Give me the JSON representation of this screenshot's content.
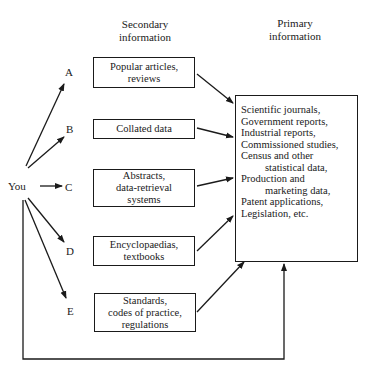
{
  "headers": {
    "secondary": "Secondary\ninformation",
    "primary": "Primary\ninformation"
  },
  "origin": "You",
  "routes": [
    {
      "letter": "A",
      "box": "Popular articles,\nreviews"
    },
    {
      "letter": "B",
      "box": "Collated data"
    },
    {
      "letter": "C",
      "box": "Abstracts,\ndata-retrieval\nsystems"
    },
    {
      "letter": "D",
      "box": "Encyclopaedias,\ntextbooks"
    },
    {
      "letter": "E",
      "box": "Standards,\ncodes of practice,\nregulations"
    }
  ],
  "primary_box": {
    "lines": [
      "Scientific journals,",
      "Government reports,",
      "Industrial reports,",
      "Commissioned studies,",
      "Census and other",
      "statistical data,",
      "Production and",
      "marketing data,",
      "Patent applications,",
      "Legislation, etc."
    ]
  }
}
